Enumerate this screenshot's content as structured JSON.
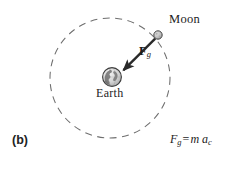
{
  "figure": {
    "panel_label": "(b)",
    "equation": {
      "lhs_symbol": "F",
      "lhs_subscript": "g",
      "operator": "=",
      "rhs_mass": "m",
      "rhs_accel_symbol": "a",
      "rhs_accel_subscript": "c",
      "plain_text": "F_g = m a_c"
    },
    "bodies": [
      {
        "name": "Moon",
        "label": "Moon",
        "cx": 158,
        "cy": 35,
        "radius": 4.2
      },
      {
        "name": "Earth",
        "label": "Earth",
        "cx": 112,
        "cy": 77,
        "radius": 9.5
      }
    ],
    "orbit": {
      "name": "moon-orbit-path",
      "cx": 110,
      "cy": 78,
      "radius": 60,
      "style": "dashed"
    },
    "vector": {
      "name": "gravitational-force-vector",
      "label_symbol": "F",
      "label_subscript": "g",
      "from_x": 155,
      "from_y": 39,
      "to_x": 121,
      "to_y": 72
    },
    "colors": {
      "ink": "#1c1c1c",
      "orbit_line": "#6e6e6e",
      "body_outline": "#3a3a3a",
      "body_fill": "#b9b9b9",
      "vector": "#2a2a2a",
      "background": "#ffffff"
    }
  }
}
